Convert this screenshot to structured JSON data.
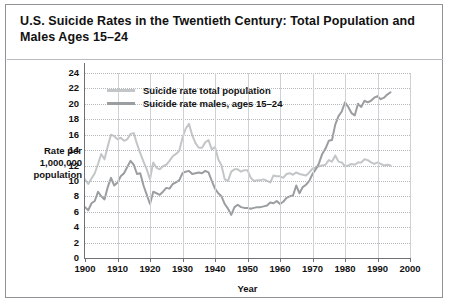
{
  "title": "U.S. Suicide Rates in the Twentieth Century: Total Population and Males Ages 15–24",
  "colors": {
    "total_population": "#c3c6c7",
    "males_15_24": "#9a9ea0",
    "frame": "#8f9396",
    "axis": "#6e7274",
    "gridline": "#b6b9bb"
  },
  "legend": {
    "position": "top-left-inside-plot",
    "entries": [
      {
        "label": "Suicide rate total population",
        "color": "#c3c6c7"
      },
      {
        "label": "Suicide rate males, ages 15–24",
        "color": "#9a9ea0"
      }
    ]
  },
  "chart_data": {
    "type": "line",
    "title": "U.S. Suicide Rates in the Twentieth Century: Total Population and Males Ages 15–24",
    "xlabel": "Year",
    "ylabel": "Rate per 1,000,000 population",
    "xlim": [
      1900,
      2000
    ],
    "ylim": [
      0,
      24
    ],
    "xticks": [
      1900,
      1910,
      1920,
      1930,
      1940,
      1950,
      1960,
      1970,
      1980,
      1990,
      2000
    ],
    "yticks": [
      0,
      2,
      4,
      6,
      8,
      10,
      12,
      14,
      16,
      18,
      20,
      22,
      24
    ],
    "grid": true,
    "legend_position": "upper left",
    "series": [
      {
        "name": "Suicide rate total population",
        "color": "#c3c6c7",
        "x": [
          1900,
          1901,
          1902,
          1903,
          1904,
          1905,
          1906,
          1907,
          1908,
          1909,
          1910,
          1911,
          1912,
          1913,
          1914,
          1915,
          1916,
          1917,
          1918,
          1919,
          1920,
          1921,
          1922,
          1923,
          1924,
          1925,
          1926,
          1927,
          1928,
          1929,
          1930,
          1931,
          1932,
          1933,
          1934,
          1935,
          1936,
          1937,
          1938,
          1939,
          1940,
          1941,
          1942,
          1943,
          1944,
          1945,
          1946,
          1947,
          1948,
          1949,
          1950,
          1951,
          1952,
          1953,
          1954,
          1955,
          1956,
          1957,
          1958,
          1959,
          1960,
          1961,
          1962,
          1963,
          1964,
          1965,
          1966,
          1967,
          1968,
          1969,
          1970,
          1971,
          1972,
          1973,
          1974,
          1975,
          1976,
          1977,
          1978,
          1979,
          1980,
          1981,
          1982,
          1983,
          1984,
          1985,
          1986,
          1987,
          1988,
          1989,
          1990,
          1991,
          1992,
          1993,
          1994
        ],
        "y": [
          10.2,
          9.6,
          10.3,
          11.0,
          12.2,
          13.5,
          12.8,
          14.5,
          16.0,
          15.8,
          15.4,
          15.6,
          15.2,
          15.4,
          16.1,
          16.2,
          14.8,
          13.6,
          12.5,
          11.5,
          10.2,
          12.4,
          11.7,
          11.5,
          11.9,
          12.1,
          12.6,
          13.2,
          13.5,
          13.9,
          15.6,
          16.8,
          17.4,
          15.9,
          14.9,
          14.3,
          14.3,
          15.0,
          15.3,
          14.1,
          14.4,
          12.8,
          12.0,
          10.2,
          10.0,
          11.2,
          11.5,
          11.5,
          11.2,
          11.4,
          11.4,
          10.4,
          10.0,
          10.1,
          10.1,
          10.2,
          10.0,
          9.8,
          10.7,
          10.6,
          10.6,
          10.4,
          10.9,
          11.0,
          10.8,
          11.1,
          10.9,
          10.8,
          10.7,
          11.1,
          11.6,
          11.7,
          11.9,
          12.0,
          12.1,
          12.7,
          12.5,
          13.3,
          12.5,
          12.4,
          11.9,
          12.0,
          12.2,
          12.1,
          12.4,
          12.4,
          12.8,
          12.7,
          12.4,
          12.2,
          12.4,
          12.2,
          12.0,
          12.1,
          12.0
        ]
      },
      {
        "name": "Suicide rate males, ages 15–24",
        "color": "#9a9ea0",
        "x": [
          1900,
          1901,
          1902,
          1903,
          1904,
          1905,
          1906,
          1907,
          1908,
          1909,
          1910,
          1911,
          1912,
          1913,
          1914,
          1915,
          1916,
          1917,
          1918,
          1919,
          1920,
          1921,
          1922,
          1923,
          1924,
          1925,
          1926,
          1927,
          1928,
          1929,
          1930,
          1931,
          1932,
          1933,
          1934,
          1935,
          1936,
          1937,
          1938,
          1939,
          1940,
          1941,
          1942,
          1943,
          1944,
          1945,
          1946,
          1947,
          1948,
          1949,
          1950,
          1951,
          1952,
          1953,
          1954,
          1955,
          1956,
          1957,
          1958,
          1959,
          1960,
          1961,
          1962,
          1963,
          1964,
          1965,
          1966,
          1967,
          1968,
          1969,
          1970,
          1971,
          1972,
          1973,
          1974,
          1975,
          1976,
          1977,
          1978,
          1979,
          1980,
          1981,
          1982,
          1983,
          1984,
          1985,
          1986,
          1987,
          1988,
          1989,
          1990,
          1991,
          1992,
          1993,
          1994
        ],
        "y": [
          6.6,
          6.2,
          7.1,
          7.4,
          8.6,
          8.0,
          7.6,
          9.2,
          10.4,
          9.4,
          9.8,
          10.6,
          11.0,
          11.8,
          12.6,
          12.1,
          10.9,
          11.0,
          9.4,
          8.2,
          7.0,
          8.6,
          8.4,
          8.2,
          8.6,
          9.1,
          9.0,
          9.6,
          9.8,
          10.1,
          11.0,
          11.2,
          11.3,
          10.9,
          11.0,
          11.1,
          11.0,
          11.3,
          11.1,
          10.0,
          9.0,
          8.4,
          8.0,
          7.0,
          6.4,
          5.6,
          6.6,
          6.9,
          6.6,
          6.5,
          6.5,
          6.4,
          6.5,
          6.6,
          6.6,
          6.7,
          6.8,
          7.2,
          7.1,
          7.4,
          7.0,
          7.3,
          7.8,
          8.0,
          8.1,
          9.4,
          8.4,
          9.2,
          9.5,
          10.0,
          10.9,
          11.5,
          12.3,
          13.5,
          14.2,
          15.2,
          15.3,
          17.3,
          18.4,
          19.0,
          20.2,
          19.6,
          18.8,
          18.5,
          20.0,
          19.6,
          20.4,
          20.2,
          20.4,
          20.8,
          21.0,
          20.6,
          20.8,
          21.2,
          21.5
        ]
      }
    ]
  }
}
